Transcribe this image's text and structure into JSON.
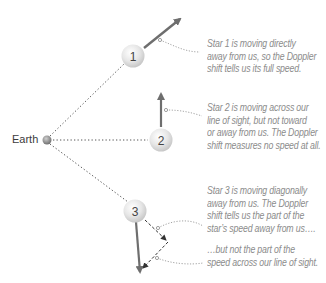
{
  "diagram": {
    "type": "doppler-shift-illustration",
    "earth": {
      "label": "Earth"
    },
    "stars": [
      {
        "id": "star-1",
        "number": "1",
        "motion": "directly away"
      },
      {
        "id": "star-2",
        "number": "2",
        "motion": "across line of sight"
      },
      {
        "id": "star-3",
        "number": "3",
        "motion": "diagonally away"
      }
    ],
    "captions": {
      "star1": [
        "Star 1 is moving directly",
        "away from us, so the Doppler",
        "shift tells us its full speed."
      ],
      "star2": [
        "Star 2 is moving across our",
        "line of sight, but not toward",
        "or away from us. The Doppler",
        "shift measures no speed at all."
      ],
      "star3a": [
        "Star 3 is moving diagonally",
        "away from us. The Doppler",
        "shift tells us the part of the",
        "star’s speed away from us…."
      ],
      "star3b": [
        "…but not the part of the",
        "speed across our line of sight."
      ]
    },
    "colors": {
      "arrow": "#6e6e6e",
      "caption_text": "#8c8c8c",
      "dotted_line": "#555555",
      "star_fill": "#e4e4e4"
    }
  }
}
